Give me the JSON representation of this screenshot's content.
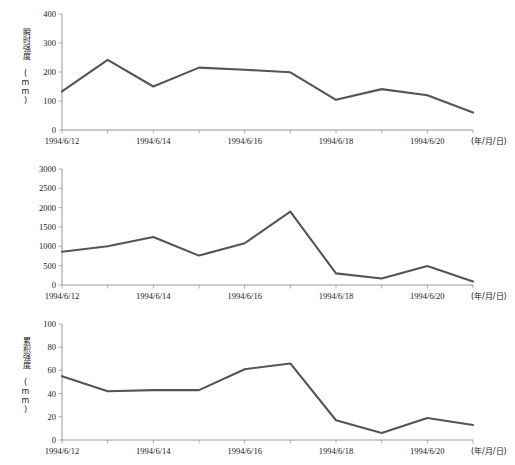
{
  "figure": {
    "x_unit_note": "(年/月/日)",
    "panels": [
      {
        "ylabel": "瞬时强度 (mm)",
        "y_ticks": [
          "0",
          "100",
          "200",
          "300",
          "400"
        ]
      },
      {
        "ylabel": "累积强度 (mm)",
        "y_ticks": [
          "0",
          "500",
          "1000",
          "1500",
          "2000",
          "2500",
          "3000"
        ]
      },
      {
        "ylabel": "影响面积 (万km²)",
        "y_ticks": [
          "0",
          "20",
          "40",
          "60",
          "80",
          "100"
        ]
      }
    ],
    "x_ticks": [
      "1994/6/12",
      "1994/6/14",
      "1994/6/16",
      "1994/6/18",
      "1994/6/20"
    ],
    "colors": {
      "line": "#555555",
      "axis": "#8c8c8c",
      "background": "#ffffff",
      "text": "#1a1a1a"
    }
  },
  "chart_data": [
    {
      "type": "line",
      "title": "",
      "xlabel": "(年/月/日)",
      "ylabel": "瞬时强度 (mm)",
      "ylim": [
        0,
        400
      ],
      "ytick_values": [
        0,
        100,
        200,
        300,
        400
      ],
      "grid": false,
      "legend": "none",
      "x": [
        "1994/6/12",
        "1994/6/13",
        "1994/6/14",
        "1994/6/15",
        "1994/6/16",
        "1994/6/17",
        "1994/6/18",
        "1994/6/19",
        "1994/6/20",
        "1994/6/21"
      ],
      "x_tick_labels": [
        "1994/6/12",
        "1994/6/14",
        "1994/6/16",
        "1994/6/18",
        "1994/6/20"
      ],
      "values": [
        133,
        242,
        150,
        215,
        208,
        199,
        104,
        141,
        120,
        60
      ]
    },
    {
      "type": "line",
      "title": "",
      "xlabel": "(年/月/日)",
      "ylabel": "累积强度 (mm)",
      "ylim": [
        0,
        3000
      ],
      "ytick_values": [
        0,
        500,
        1000,
        1500,
        2000,
        2500,
        3000
      ],
      "grid": false,
      "legend": "none",
      "x": [
        "1994/6/12",
        "1994/6/13",
        "1994/6/14",
        "1994/6/15",
        "1994/6/16",
        "1994/6/17",
        "1994/6/18",
        "1994/6/19",
        "1994/6/20",
        "1994/6/21"
      ],
      "x_tick_labels": [
        "1994/6/12",
        "1994/6/14",
        "1994/6/16",
        "1994/6/18",
        "1994/6/20"
      ],
      "values": [
        860,
        1000,
        1240,
        760,
        1080,
        1900,
        300,
        170,
        490,
        90
      ]
    },
    {
      "type": "line",
      "title": "",
      "xlabel": "(年/月/日)",
      "ylabel": "影响面积 (万km²)",
      "ylim": [
        0,
        100
      ],
      "ytick_values": [
        0,
        20,
        40,
        60,
        80,
        100
      ],
      "grid": false,
      "legend": "none",
      "x": [
        "1994/6/12",
        "1994/6/13",
        "1994/6/14",
        "1994/6/15",
        "1994/6/16",
        "1994/6/17",
        "1994/6/18",
        "1994/6/19",
        "1994/6/20",
        "1994/6/21"
      ],
      "x_tick_labels": [
        "1994/6/12",
        "1994/6/14",
        "1994/6/16",
        "1994/6/18",
        "1994/6/20"
      ],
      "values": [
        55,
        42,
        43,
        43,
        61,
        66,
        17,
        6,
        19,
        13
      ]
    }
  ]
}
